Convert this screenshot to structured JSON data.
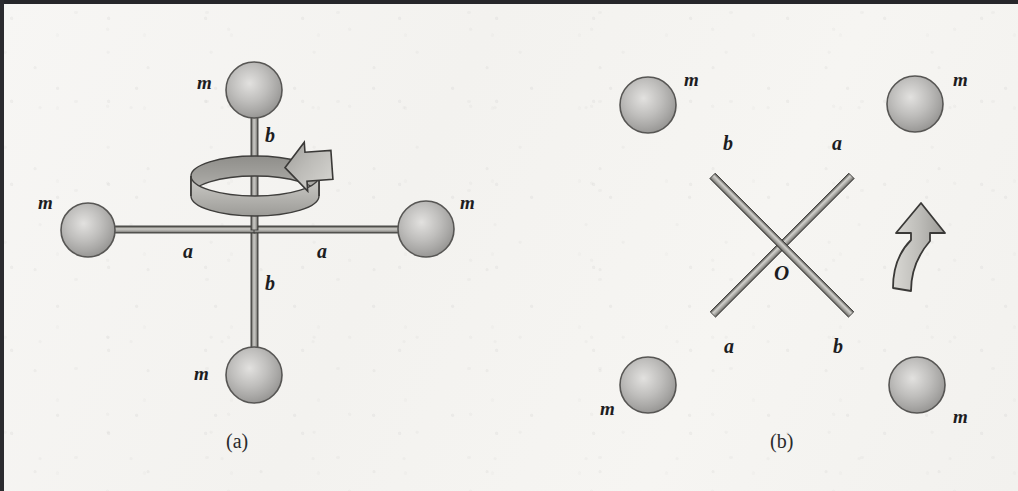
{
  "figure": {
    "domain": "physics-diagram",
    "background_color": "#f5f4f1",
    "border_color": "#26262a",
    "ink_color": "#1d1d1f",
    "sphere_fill": "#b9b8b6",
    "sphere_outline": "#4a4a4c",
    "rod_color": "#9b9a98"
  },
  "panels": [
    {
      "id": "a",
      "caption": "(a)",
      "description": "cross-shaped rigid body rotating about vertical axis",
      "rotation_indicator": "circular-ribbon-arrow",
      "masses": [
        {
          "label": "m",
          "position": "top"
        },
        {
          "label": "m",
          "position": "left"
        },
        {
          "label": "m",
          "position": "right"
        },
        {
          "label": "m",
          "position": "bottom"
        }
      ],
      "dimensions": [
        {
          "label": "b",
          "position": "upper-vertical"
        },
        {
          "label": "a",
          "position": "left-horizontal"
        },
        {
          "label": "a",
          "position": "right-horizontal"
        },
        {
          "label": "b",
          "position": "lower-vertical"
        }
      ]
    },
    {
      "id": "b",
      "caption": "(b)",
      "description": "X-shaped rigid body rotating about axis through O",
      "rotation_indicator": "curved-up-arrow",
      "origin_label": "O",
      "masses": [
        {
          "label": "m",
          "position": "top-left"
        },
        {
          "label": "m",
          "position": "top-right"
        },
        {
          "label": "m",
          "position": "bottom-left"
        },
        {
          "label": "m",
          "position": "bottom-right"
        }
      ],
      "dimensions": [
        {
          "label": "b",
          "position": "upper-left-arm"
        },
        {
          "label": "a",
          "position": "upper-right-arm"
        },
        {
          "label": "a",
          "position": "lower-left-arm"
        },
        {
          "label": "b",
          "position": "lower-right-arm"
        }
      ]
    }
  ],
  "labels": {
    "panel_a": {
      "m_top": "m",
      "m_left": "m",
      "m_right": "m",
      "m_bottom": "m",
      "b_upper": "b",
      "a_left": "a",
      "a_right": "a",
      "b_lower": "b",
      "caption": "(a)"
    },
    "panel_b": {
      "m_top_left": "m",
      "m_top_right": "m",
      "m_bottom_left": "m",
      "m_bottom_right": "m",
      "b_upper_left": "b",
      "a_upper_right": "a",
      "a_lower_left": "a",
      "b_lower_right": "b",
      "origin": "O",
      "caption": "(b)"
    }
  }
}
